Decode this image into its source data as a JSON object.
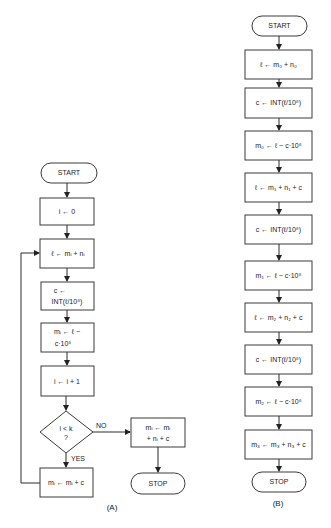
{
  "flowchart_a": {
    "caption": "(A)",
    "start": "START",
    "steps": [
      "i ← 0",
      "ℓ ← mᵢ + nᵢ",
      "c ←",
      "INT(ℓ/10⁸)",
      "mᵢ ← ℓ −",
      "c·10⁸",
      "i ← i + 1"
    ],
    "decision": {
      "line1": "i < k",
      "line2": "?",
      "yes": "YES",
      "no": "NO"
    },
    "no_box": {
      "line1": "mᵢ ← mᵢ",
      "line2": "+ nᵢ + c"
    },
    "yes_box": "mᵢ ← mᵢ + c",
    "stop": "STOP"
  },
  "flowchart_b": {
    "caption": "(B)",
    "start": "START",
    "steps": [
      "ℓ ← m₀ + n₀",
      "c ← INT(ℓ/10⁸)",
      "m₀ ← ℓ − c·10⁸",
      "ℓ ← m₁ + n₁ + c",
      "c ← INT(ℓ/10⁸)",
      "m₁ ← ℓ − c·10⁸",
      "ℓ ← m₂ + n₂ + c",
      "c ← INT(ℓ/10⁸)",
      "m₂ ← ℓ − c·10⁸",
      "m₃ ← m₃ + n₃ + c"
    ],
    "stop": "STOP"
  }
}
